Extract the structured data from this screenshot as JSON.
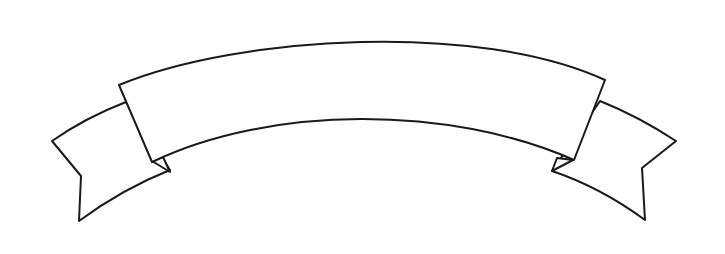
{
  "illustration": {
    "subject": "blank curved ribbon banner",
    "style": "line-art",
    "banner_text": "",
    "colors": {
      "background": "#ffffff",
      "stroke": "#1a1a1a",
      "fill": "#ffffff"
    }
  }
}
